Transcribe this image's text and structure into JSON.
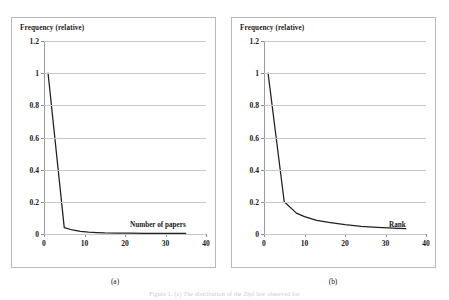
{
  "figure": {
    "caption": "Figure 1. (a) The distribution of the Zipf law observed for",
    "subcaptions": [
      "(a)",
      "(b)"
    ]
  },
  "chart_data": [
    {
      "type": "line",
      "title": "",
      "ylabel": "Frequency (relative)",
      "xlabel": "Number of papers",
      "xlim": [
        0,
        40
      ],
      "ylim": [
        0,
        1.2
      ],
      "yticks": [
        "0",
        "0.2",
        "0.4",
        "0.6",
        "0.8",
        "1",
        "1.2"
      ],
      "ytick_values": [
        0,
        0.2,
        0.4,
        0.6,
        0.8,
        1,
        1.2
      ],
      "xticks": [
        "0",
        "10",
        "20",
        "30",
        "40"
      ],
      "xtick_values": [
        0,
        10,
        20,
        30,
        40
      ],
      "grid": "horizontal",
      "legend": "none",
      "series": [
        {
          "name": "relative frequency",
          "x": [
            1,
            5,
            7,
            9,
            11,
            13,
            15,
            18,
            21,
            25,
            30,
            35
          ],
          "values": [
            1.0,
            0.04,
            0.025,
            0.017,
            0.012,
            0.009,
            0.007,
            0.006,
            0.005,
            0.004,
            0.004,
            0.004
          ]
        }
      ]
    },
    {
      "type": "line",
      "title": "",
      "ylabel": "Frequency (relative)",
      "xlabel": "Rank",
      "xlim": [
        0,
        40
      ],
      "ylim": [
        0,
        1.2
      ],
      "yticks": [
        "0",
        "0.2",
        "0.4",
        "0.6",
        "0.8",
        "1",
        "1.2"
      ],
      "ytick_values": [
        0,
        0.2,
        0.4,
        0.6,
        0.8,
        1,
        1.2
      ],
      "xticks": [
        "0",
        "10",
        "20",
        "30",
        "40"
      ],
      "xtick_values": [
        0,
        10,
        20,
        30,
        40
      ],
      "grid": "horizontal",
      "legend": "none",
      "series": [
        {
          "name": "relative frequency",
          "x": [
            1,
            5,
            8,
            10,
            13,
            16,
            20,
            24,
            28,
            32,
            35
          ],
          "values": [
            1.0,
            0.2,
            0.13,
            0.108,
            0.085,
            0.072,
            0.058,
            0.048,
            0.041,
            0.036,
            0.033
          ]
        }
      ]
    }
  ],
  "colors": {
    "line": "#231f20",
    "gridline": "#c8c8c8",
    "frame": "#b9b9b9",
    "background": "#ffffff"
  }
}
